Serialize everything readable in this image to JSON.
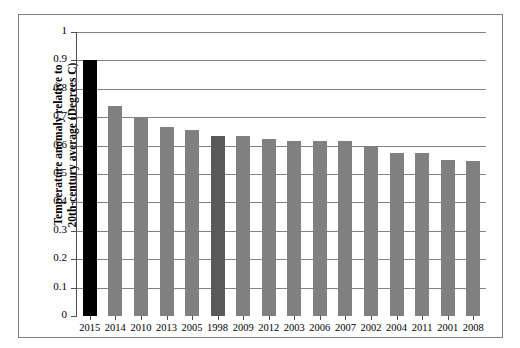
{
  "chart_data": {
    "type": "bar",
    "title": "",
    "subtitle": "",
    "xlabel": "",
    "ylabel": "Temperature anomaly relative to 20th-century average (Degrees C)",
    "ylabel_line1": "Temperature anomaly relative to",
    "ylabel_line2": "20th-century average (Degrees C)",
    "categories": [
      "2015",
      "2014",
      "2010",
      "2013",
      "2005",
      "1998",
      "2009",
      "2012",
      "2003",
      "2006",
      "2007",
      "2002",
      "2004",
      "2011",
      "2001",
      "2008"
    ],
    "values": [
      0.9,
      0.74,
      0.7,
      0.665,
      0.655,
      0.635,
      0.635,
      0.625,
      0.615,
      0.615,
      0.615,
      0.6,
      0.575,
      0.575,
      0.55,
      0.545
    ],
    "bar_colors": [
      "#000000",
      "#808080",
      "#808080",
      "#808080",
      "#808080",
      "#595959",
      "#808080",
      "#808080",
      "#808080",
      "#808080",
      "#808080",
      "#808080",
      "#808080",
      "#808080",
      "#808080",
      "#808080"
    ],
    "ylim": [
      0,
      1
    ],
    "ytick_step": 0.1,
    "ytick_labels": [
      "0",
      "0.1",
      "0.2",
      "0.3",
      "0.4",
      "0.5",
      "0.6",
      "0.7",
      "0.8",
      "0.9",
      "1"
    ],
    "grid": true,
    "grid_axis": "y",
    "legend": null,
    "legend_position": "none",
    "gridline_color": "#808080",
    "axis_color": "#4d4d4d",
    "frame_color": "#808080",
    "background_color": "#ffffff"
  }
}
